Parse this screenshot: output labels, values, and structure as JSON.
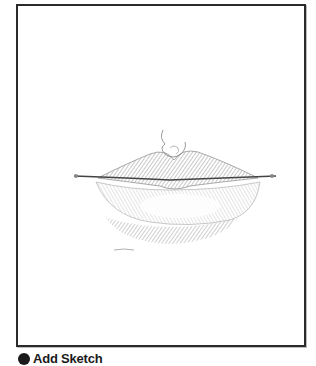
{
  "canvas": {
    "subject": "pencil sketch of lips",
    "frame_color": "#2b2b2b",
    "sketch_color": "#6e6e6e"
  },
  "footer": {
    "icon": "circle-icon",
    "label": "Add Sketch"
  }
}
